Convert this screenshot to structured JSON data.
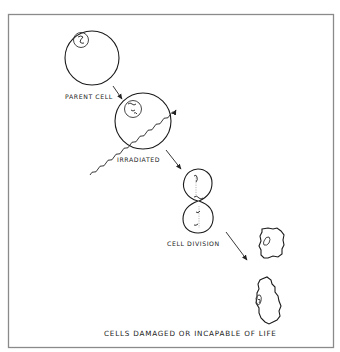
{
  "diagram": {
    "stages": [
      {
        "id": "parent",
        "label": "PARENT CELL"
      },
      {
        "id": "irradiated",
        "label": "IRRADIATED"
      },
      {
        "id": "division",
        "label": "CELL DIVISION"
      },
      {
        "id": "damaged",
        "label": "CELLS DAMAGED OR INCAPABLE OF LIFE"
      }
    ],
    "colors": {
      "line": "#1a1a1a",
      "frame": "#8a8a8a",
      "background": "#ffffff"
    }
  }
}
